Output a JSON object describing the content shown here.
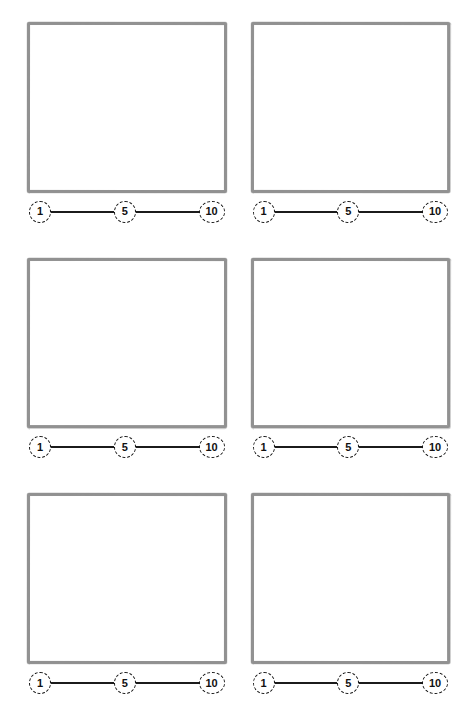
{
  "page": {
    "background_color": "#ffffff",
    "box_border_color": "#9c9c9c",
    "scale_line_color": "#1b1b1b",
    "scale_text_color": "#111111",
    "columns": 2,
    "rows": 3
  },
  "scale": {
    "name": "rating-scale",
    "min_label": "1",
    "mid_label": "5",
    "max_label": "10"
  },
  "panels": [
    {
      "id": "panel-1",
      "drawing_area": "",
      "scale": {
        "min": "1",
        "mid": "5",
        "max": "10"
      }
    },
    {
      "id": "panel-2",
      "drawing_area": "",
      "scale": {
        "min": "1",
        "mid": "5",
        "max": "10"
      }
    },
    {
      "id": "panel-3",
      "drawing_area": "",
      "scale": {
        "min": "1",
        "mid": "5",
        "max": "10"
      }
    },
    {
      "id": "panel-4",
      "drawing_area": "",
      "scale": {
        "min": "1",
        "mid": "5",
        "max": "10"
      }
    },
    {
      "id": "panel-5",
      "drawing_area": "",
      "scale": {
        "min": "1",
        "mid": "5",
        "max": "10"
      }
    },
    {
      "id": "panel-6",
      "drawing_area": "",
      "scale": {
        "min": "1",
        "mid": "5",
        "max": "10"
      }
    }
  ]
}
